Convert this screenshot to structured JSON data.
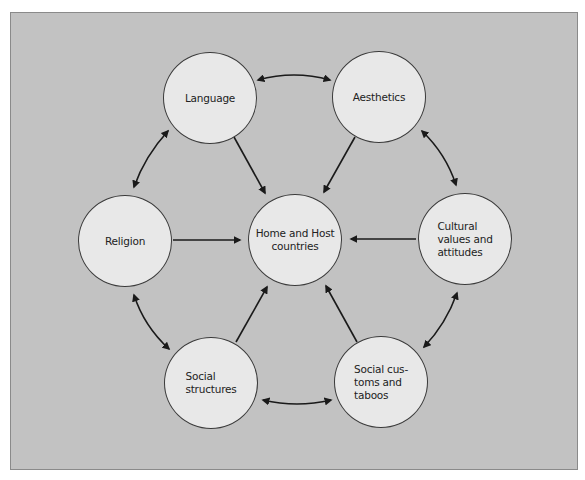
{
  "diagram": {
    "type": "hub-and-spoke",
    "center": {
      "id": "home-host",
      "label": "Home and Host\ncountries"
    },
    "nodes": [
      {
        "id": "language",
        "label": "Language"
      },
      {
        "id": "aesthetics",
        "label": "Aesthetics"
      },
      {
        "id": "religion",
        "label": "Religion"
      },
      {
        "id": "cultural",
        "label": "Cultural\nvalues and\nattitudes"
      },
      {
        "id": "social-structures",
        "label": "Social\nstructures"
      },
      {
        "id": "social-customs",
        "label": "Social cus-\ntoms and\ntaboos"
      }
    ],
    "edges": [
      {
        "from": "language",
        "to": "home-host",
        "type": "directed"
      },
      {
        "from": "aesthetics",
        "to": "home-host",
        "type": "directed"
      },
      {
        "from": "religion",
        "to": "home-host",
        "type": "directed"
      },
      {
        "from": "cultural",
        "to": "home-host",
        "type": "directed"
      },
      {
        "from": "social-structures",
        "to": "home-host",
        "type": "directed"
      },
      {
        "from": "social-customs",
        "to": "home-host",
        "type": "directed"
      },
      {
        "from": "language",
        "to": "aesthetics",
        "type": "bidirectional"
      },
      {
        "from": "aesthetics",
        "to": "cultural",
        "type": "bidirectional"
      },
      {
        "from": "cultural",
        "to": "social-customs",
        "type": "bidirectional"
      },
      {
        "from": "social-customs",
        "to": "social-structures",
        "type": "bidirectional"
      },
      {
        "from": "social-structures",
        "to": "religion",
        "type": "bidirectional"
      },
      {
        "from": "religion",
        "to": "language",
        "type": "bidirectional"
      }
    ],
    "colors": {
      "background": "#c2c2c2",
      "node_fill": "#e8e8e8",
      "stroke": "#1a1a1a"
    }
  }
}
